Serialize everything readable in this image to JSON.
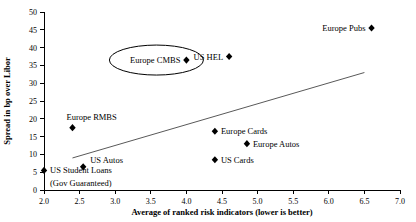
{
  "chart_data": {
    "type": "scatter",
    "title": "",
    "xlabel": "Average of ranked risk indicators (lower is better)",
    "ylabel": "Spread in bp over Libor",
    "xlim": [
      2.0,
      7.0
    ],
    "ylim": [
      0,
      50
    ],
    "grid": false,
    "legend": "none",
    "xticks": [
      "2.0",
      "2.5",
      "3.0",
      "3.5",
      "4.0",
      "4.5",
      "5.0",
      "5.5",
      "6.0",
      "6.5",
      "7.0"
    ],
    "xtick_values": [
      2.0,
      2.5,
      3.0,
      3.5,
      4.0,
      4.5,
      5.0,
      5.5,
      6.0,
      6.5,
      7.0
    ],
    "yticks": [
      "0",
      "5",
      "10",
      "15",
      "20",
      "25",
      "30",
      "35",
      "40",
      "45",
      "50"
    ],
    "ytick_values": [
      0,
      5,
      10,
      15,
      20,
      25,
      30,
      35,
      40,
      45,
      50
    ],
    "points": [
      {
        "label": "Europe CMBS",
        "x": 4.0,
        "y": 36.5,
        "label_position": "left",
        "highlighted": true
      },
      {
        "label": "US HEL",
        "x": 4.6,
        "y": 37.5,
        "label_position": "left",
        "highlighted": false
      },
      {
        "label": "Europe Pubs",
        "x": 6.6,
        "y": 45.5,
        "label_position": "left",
        "highlighted": false
      },
      {
        "label": "Europe RMBS",
        "x": 2.4,
        "y": 17.5,
        "label_position": "above",
        "highlighted": false
      },
      {
        "label": "Europe Cards",
        "x": 4.4,
        "y": 16.5,
        "label_position": "right",
        "highlighted": false
      },
      {
        "label": "Europe Autos",
        "x": 4.85,
        "y": 13.0,
        "label_position": "right",
        "highlighted": false
      },
      {
        "label": "US Cards",
        "x": 4.4,
        "y": 8.5,
        "label_position": "right",
        "highlighted": false
      },
      {
        "label": "US Autos",
        "x": 2.55,
        "y": 6.5,
        "label_position": "above-right",
        "highlighted": false
      },
      {
        "label": "US Student Loans",
        "x": 2.0,
        "y": 5.5,
        "label_position": "right",
        "highlighted": false
      },
      {
        "label": "(Gov Guaranteed)",
        "x": 2.0,
        "y": 2.0,
        "label_position": "right-only",
        "highlighted": false
      }
    ],
    "trend_line": {
      "x_start": 2.4,
      "y_start": 9.0,
      "x_end": 6.5,
      "y_end": 33.0,
      "color": "#595959"
    }
  }
}
